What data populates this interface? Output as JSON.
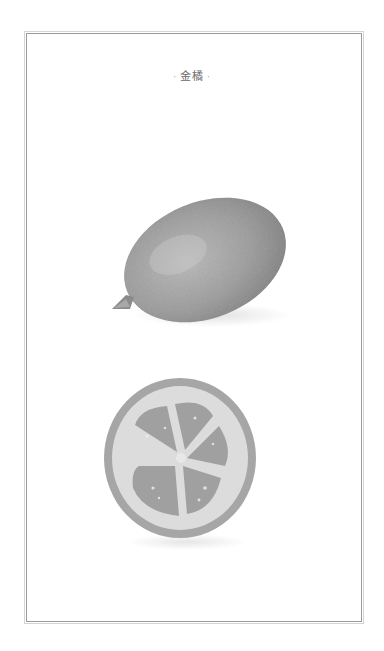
{
  "page": {
    "title": "金橘",
    "title_prefix": "·",
    "title_suffix": "·"
  },
  "illustrations": {
    "whole_fruit": "kumquat-whole-illustration",
    "cross_section": "kumquat-cross-section-illustration"
  },
  "colors": {
    "background": "#ffffff",
    "frame_outer": "#d4d4d4",
    "frame_inner": "#9a9a9a",
    "title_text": "#6a6a6a",
    "fruit_gray": "#9c9c9c"
  }
}
